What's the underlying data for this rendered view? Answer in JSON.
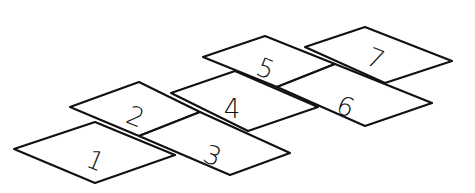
{
  "illustration": {
    "subject": "hopscotch court",
    "stroke_color": "#111111",
    "background": "#ffffff",
    "squares": [
      {
        "label": "1",
        "points": "14,149 95,122 175,155 95,183",
        "tx": 95,
        "ty": 162
      },
      {
        "label": "2",
        "points": "70,107 139,82 200,112 139,136",
        "tx": 135,
        "ty": 118
      },
      {
        "label": "3",
        "points": "139,136 200,112 290,153 230,175",
        "tx": 212,
        "ty": 157
      },
      {
        "label": "4",
        "points": "171,93 235,71 318,107 248,131",
        "tx": 232,
        "ty": 110
      },
      {
        "label": "5",
        "points": "203,57 265,36 335,64 277,87",
        "tx": 265,
        "ty": 70
      },
      {
        "label": "6",
        "points": "277,87 335,64 432,103 365,126",
        "tx": 345,
        "ty": 108
      },
      {
        "label": "7",
        "points": "305,47 365,27 452,61 385,83",
        "tx": 375,
        "ty": 60
      }
    ]
  }
}
